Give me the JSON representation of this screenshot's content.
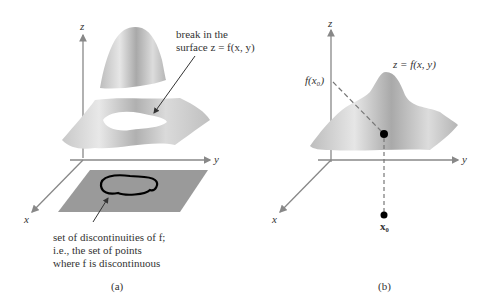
{
  "figure": {
    "panel_a": {
      "caption": "(a)",
      "axes": {
        "z": "z",
        "y": "y",
        "x": "x"
      },
      "annotation_break": [
        "break in the",
        "surface z = f(x, y)"
      ],
      "annotation_set": [
        "set of discontinuities of f;",
        "i.e., the set of points",
        "where f is discontinuous"
      ]
    },
    "panel_b": {
      "caption": "(b)",
      "axes": {
        "z": "z",
        "y": "y",
        "x": "x"
      },
      "surface_label": "z = f(x, y)",
      "value_label": "f(x₀)",
      "point_label": "x₀"
    }
  }
}
